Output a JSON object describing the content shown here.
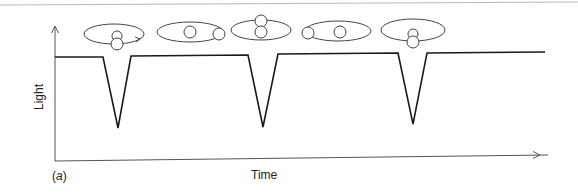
{
  "figure": {
    "panel_label": "(a)",
    "panel_letter": "a",
    "x_axis_label": "Time",
    "y_axis_label": "Light",
    "colors": {
      "curve": "#1a1a1a",
      "axis": "#555555",
      "orbit": "#444444",
      "top_rule": "#bbbbbb"
    }
  },
  "chart_data": {
    "type": "line",
    "title": "",
    "xlabel": "Time",
    "ylabel": "Light",
    "grid": false,
    "x": [
      55,
      103,
      118,
      131,
      248,
      263,
      278,
      398,
      413,
      427,
      545
    ],
    "y_pixels": [
      57,
      57,
      128,
      56,
      55,
      127,
      54,
      53,
      124,
      53,
      52
    ],
    "series": [
      {
        "name": "Light",
        "points": [
          {
            "x": 55,
            "y": 57
          },
          {
            "x": 103,
            "y": 57
          },
          {
            "x": 118,
            "y": 128
          },
          {
            "x": 131,
            "y": 56
          },
          {
            "x": 248,
            "y": 55
          },
          {
            "x": 263,
            "y": 127
          },
          {
            "x": 278,
            "y": 54
          },
          {
            "x": 398,
            "y": 53
          },
          {
            "x": 413,
            "y": 124
          },
          {
            "x": 427,
            "y": 53
          },
          {
            "x": 545,
            "y": 52
          }
        ]
      }
    ],
    "annotations": [
      "eclipse 1",
      "eclipse 2",
      "eclipse 3"
    ]
  },
  "orbits": [
    {
      "name": "orbit-phase-1",
      "ellipse": {
        "cx": 114,
        "cy": 34,
        "rx": 30,
        "ry": 10
      },
      "back_star": {
        "cx": 117,
        "cy": 36,
        "r": 5
      },
      "front_star": {
        "cx": 117,
        "cy": 44,
        "r": 6
      },
      "arrow": true
    },
    {
      "name": "orbit-phase-2",
      "ellipse": {
        "cx": 190,
        "cy": 32,
        "rx": 33,
        "ry": 10
      },
      "back_star": {
        "cx": 190,
        "cy": 32,
        "r": 6
      },
      "front_star": {
        "cx": 219,
        "cy": 34,
        "r": 6
      },
      "arrow": false
    },
    {
      "name": "orbit-phase-3",
      "ellipse": {
        "cx": 261,
        "cy": 30,
        "rx": 30,
        "ry": 10
      },
      "back_star": {
        "cx": 261,
        "cy": 21,
        "r": 6
      },
      "front_star": {
        "cx": 261,
        "cy": 32,
        "r": 6
      },
      "arrow": false
    },
    {
      "name": "orbit-phase-4",
      "ellipse": {
        "cx": 338,
        "cy": 31,
        "rx": 33,
        "ry": 10
      },
      "back_star": {
        "cx": 340,
        "cy": 32,
        "r": 6
      },
      "front_star": {
        "cx": 308,
        "cy": 33,
        "r": 6
      },
      "arrow": false
    },
    {
      "name": "orbit-phase-5",
      "ellipse": {
        "cx": 413,
        "cy": 30,
        "rx": 32,
        "ry": 11
      },
      "back_star": {
        "cx": 413,
        "cy": 34,
        "r": 5
      },
      "front_star": {
        "cx": 413,
        "cy": 42,
        "r": 6
      },
      "arrow": false
    }
  ]
}
